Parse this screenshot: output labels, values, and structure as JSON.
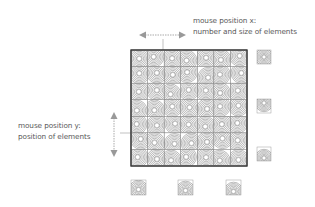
{
  "annotations": {
    "x_axis": {
      "line1": "mouse position x:",
      "line2": "number and size of elements"
    },
    "y_axis": {
      "line1": "mouse position y:",
      "line2": "position of elements"
    }
  },
  "grid": {
    "rows": 7,
    "cols": 7,
    "element": "concentric-circles"
  },
  "examples_right": [
    {
      "variant": "center"
    },
    {
      "variant": "upper"
    },
    {
      "variant": "lower"
    }
  ],
  "examples_bottom": [
    {
      "variant": "few-large"
    },
    {
      "variant": "medium"
    },
    {
      "variant": "many-small"
    }
  ],
  "colors": {
    "stroke": "#555555",
    "arrow": "#999999",
    "text": "#5a5a5a"
  }
}
